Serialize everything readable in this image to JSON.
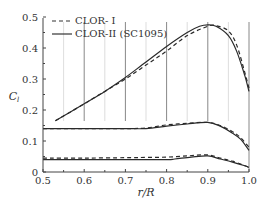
{
  "chart_data": {
    "type": "line",
    "title": "",
    "xlabel": "r/R",
    "ylabel": "C_l",
    "xlim": [
      0.5,
      1.0
    ],
    "ylim": [
      0,
      0.5
    ],
    "xticks": [
      "0.5",
      "0.6",
      "0.7",
      "0.8",
      "0.9",
      "1.0"
    ],
    "yticks": [
      "0",
      "0.1",
      "0.2",
      "0.3",
      "0.4",
      "0.5"
    ],
    "grid": "vertical lines at r/R = 0.55..1.0 (dark at 0.6,0.7,0.8,0.9,1.0; light at 0.55,0.65,0.75,0.85,0.95)",
    "legend_position": "upper left",
    "legend": [
      "CLOR- I",
      "CLOR-II (SC1095)"
    ],
    "series": [
      {
        "name": "CLOR- I",
        "style": "dashed",
        "group": "upper",
        "x": [
          0.53,
          0.6,
          0.65,
          0.7,
          0.75,
          0.8,
          0.85,
          0.9,
          0.92,
          0.95,
          0.97,
          0.99,
          1.0
        ],
        "y": [
          0.165,
          0.22,
          0.26,
          0.3,
          0.345,
          0.39,
          0.44,
          0.47,
          0.472,
          0.455,
          0.41,
          0.32,
          0.27
        ]
      },
      {
        "name": "CLOR-II (SC1095)",
        "style": "solid",
        "group": "upper",
        "x": [
          0.53,
          0.6,
          0.65,
          0.7,
          0.75,
          0.8,
          0.85,
          0.88,
          0.9,
          0.92,
          0.95,
          0.97,
          0.99,
          1.0
        ],
        "y": [
          0.165,
          0.22,
          0.26,
          0.305,
          0.355,
          0.405,
          0.45,
          0.47,
          0.475,
          0.47,
          0.44,
          0.39,
          0.31,
          0.26
        ]
      },
      {
        "name": "CLOR- I",
        "style": "dashed",
        "group": "middle",
        "x": [
          0.5,
          0.6,
          0.7,
          0.75,
          0.8,
          0.85,
          0.9,
          0.93,
          0.96,
          0.98,
          1.0
        ],
        "y": [
          0.14,
          0.14,
          0.14,
          0.142,
          0.152,
          0.157,
          0.16,
          0.15,
          0.13,
          0.11,
          0.08
        ]
      },
      {
        "name": "CLOR-II (SC1095)",
        "style": "solid",
        "group": "middle",
        "x": [
          0.5,
          0.6,
          0.7,
          0.75,
          0.8,
          0.85,
          0.9,
          0.93,
          0.96,
          0.98,
          1.0
        ],
        "y": [
          0.14,
          0.14,
          0.14,
          0.14,
          0.148,
          0.155,
          0.16,
          0.148,
          0.125,
          0.105,
          0.07
        ]
      },
      {
        "name": "CLOR- I",
        "style": "dashed",
        "group": "lower",
        "x": [
          0.5,
          0.6,
          0.7,
          0.75,
          0.8,
          0.85,
          0.9,
          0.93,
          0.96,
          0.99,
          1.0
        ],
        "y": [
          0.045,
          0.045,
          0.046,
          0.047,
          0.048,
          0.052,
          0.055,
          0.045,
          0.035,
          0.02,
          0.015
        ]
      },
      {
        "name": "CLOR-II (SC1095)",
        "style": "solid",
        "group": "lower",
        "x": [
          0.5,
          0.6,
          0.7,
          0.8,
          0.82,
          0.86,
          0.9,
          0.93,
          0.96,
          0.99,
          1.0
        ],
        "y": [
          0.04,
          0.04,
          0.04,
          0.04,
          0.042,
          0.048,
          0.052,
          0.042,
          0.032,
          0.02,
          0.015
        ]
      }
    ]
  }
}
